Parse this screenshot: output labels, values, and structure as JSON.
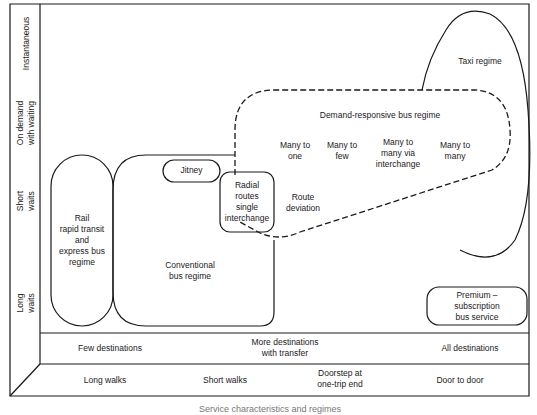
{
  "y_axis": {
    "levels": [
      {
        "id": "instantaneous",
        "label": "Instantaneous"
      },
      {
        "id": "on_demand",
        "label_line1": "On demand",
        "label_line2": "with waiting"
      },
      {
        "id": "short_waits",
        "label_line1": "Short",
        "label_line2": "waits"
      },
      {
        "id": "long_waits",
        "label_line1": "Long",
        "label_line2": "waits"
      }
    ]
  },
  "x_axis_destinations": {
    "few": "Few destinations",
    "more_line1": "More destinations",
    "more_line2": "with transfer",
    "all": "All destinations"
  },
  "x_axis_walks": {
    "long": "Long walks",
    "short": "Short walks",
    "doorstep_line1": "Doorstep at",
    "doorstep_line2": "one-trip end",
    "door": "Door to door"
  },
  "regions": {
    "rail": {
      "l1": "Rail",
      "l2": "rapid transit",
      "l3": "and",
      "l4": "express bus",
      "l5": "regime"
    },
    "conventional": {
      "l1": "Conventional",
      "l2": "bus regime"
    },
    "jitney": {
      "label": "Jitney"
    },
    "radial": {
      "l1": "Radial",
      "l2": "routes",
      "l3": "single",
      "l4": "interchange"
    },
    "route_deviation": {
      "l1": "Route",
      "l2": "deviation"
    },
    "demand_responsive": {
      "label": "Demand-responsive bus regime"
    },
    "many_to_one": {
      "l1": "Many to",
      "l2": "one"
    },
    "many_to_few": {
      "l1": "Many to",
      "l2": "few"
    },
    "many_to_many_via": {
      "l1": "Many to",
      "l2": "many via",
      "l3": "interchange"
    },
    "many_to_many": {
      "l1": "Many to",
      "l2": "many"
    },
    "taxi": {
      "label": "Taxi regime"
    },
    "premium": {
      "l1": "Premium –",
      "l2": "subscription",
      "l3": "bus service"
    }
  },
  "caption": "Service characteristics and regimes"
}
